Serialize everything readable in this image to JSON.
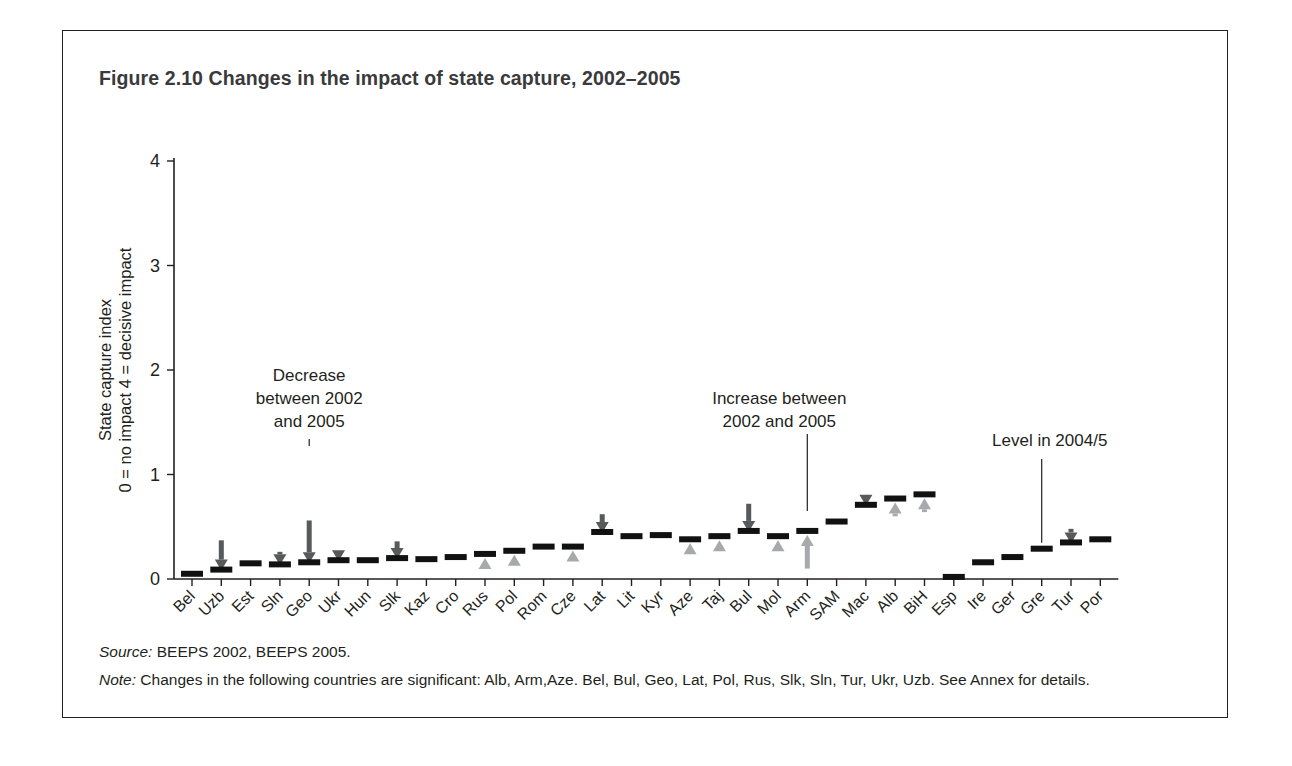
{
  "figure": {
    "title": "Figure 2.10  Changes in the impact of state capture, 2002–2005",
    "source_label": "Source:",
    "source_text": " BEEPS 2002, BEEPS 2005.",
    "note_label": "Note:",
    "note_text": " Changes in the following countries are significant: Alb, Arm,Aze. Bel, Bul, Geo, Lat, Pol, Rus, Slk, Sln, Tur, Ukr, Uzb. See Annex for details."
  },
  "annotations": [
    {
      "name": "decrease-annotation",
      "lines": [
        "Decrease",
        "between 2002",
        "and 2005"
      ],
      "target": "Geo"
    },
    {
      "name": "increase-annotation",
      "lines": [
        "Increase between",
        "2002 and 2005"
      ],
      "target": "Arm"
    },
    {
      "name": "level-annotation",
      "lines": [
        "Level in 2004/5"
      ],
      "target": "Gre"
    }
  ],
  "colors": {
    "level_bar": "#111111",
    "decrease_arrow": "#58595b",
    "increase_arrow": "#a7a9ac",
    "axis": "#231f20",
    "title": "#3a3a3c"
  },
  "chart_data": {
    "type": "bar",
    "title": "Figure 2.10  Changes in the impact of state capture, 2002–2005",
    "xlabel": "",
    "ylabel": "State capture index\n0 = no impact  4 = decisive impact",
    "ylabel_line1": "State capture index",
    "ylabel_line2": "0 = no impact  4 = decisive impact",
    "ylim": [
      0,
      4
    ],
    "yticks": [
      0,
      1,
      2,
      3,
      4
    ],
    "ytick_labels": [
      "0",
      "1",
      "2",
      "3",
      "4"
    ],
    "grid": false,
    "legend": "none",
    "categories": [
      "Bel",
      "Uzb",
      "Est",
      "Sln",
      "Geo",
      "Ukr",
      "Hun",
      "Slk",
      "Kaz",
      "Cro",
      "Rus",
      "Pol",
      "Rom",
      "Cze",
      "Lat",
      "Lit",
      "Kyr",
      "Aze",
      "Taj",
      "Bul",
      "Mol",
      "Arm",
      "SAM",
      "Mac",
      "Alb",
      "BiH",
      "Esp",
      "Ire",
      "Ger",
      "Gre",
      "Tur",
      "Por"
    ],
    "series": [
      {
        "name": "Level in 2004/5",
        "values": [
          0.05,
          0.09,
          0.15,
          0.14,
          0.16,
          0.18,
          0.18,
          0.2,
          0.19,
          0.21,
          0.24,
          0.27,
          0.31,
          0.31,
          0.45,
          0.41,
          0.42,
          0.38,
          0.41,
          0.46,
          0.41,
          0.46,
          0.55,
          0.71,
          0.77,
          0.81,
          0.02,
          0.16,
          0.21,
          0.29,
          0.35,
          0.38
        ]
      },
      {
        "name": "Decrease between 2002 and 2005",
        "values": [
          0.0,
          0.28,
          0.0,
          0.12,
          0.4,
          0.09,
          0.0,
          0.16,
          0.0,
          0.0,
          0.0,
          0.0,
          0.0,
          0.0,
          0.17,
          0.0,
          0.0,
          0.0,
          0.0,
          0.26,
          0.0,
          0.0,
          0.0,
          0.06,
          0.0,
          0.0,
          0.0,
          0.0,
          0.0,
          0.0,
          0.13,
          0.0
        ]
      },
      {
        "name": "Increase between 2002 and 2005",
        "values": [
          0.0,
          0.0,
          0.0,
          0.0,
          0.0,
          0.0,
          0.0,
          0.0,
          0.0,
          0.0,
          0.07,
          0.05,
          0.0,
          0.07,
          0.0,
          0.0,
          0.0,
          0.12,
          0.09,
          0.0,
          0.07,
          0.36,
          0.0,
          0.0,
          0.17,
          0.17,
          0.0,
          0.0,
          0.0,
          0.0,
          0.0,
          0.0
        ]
      }
    ]
  }
}
